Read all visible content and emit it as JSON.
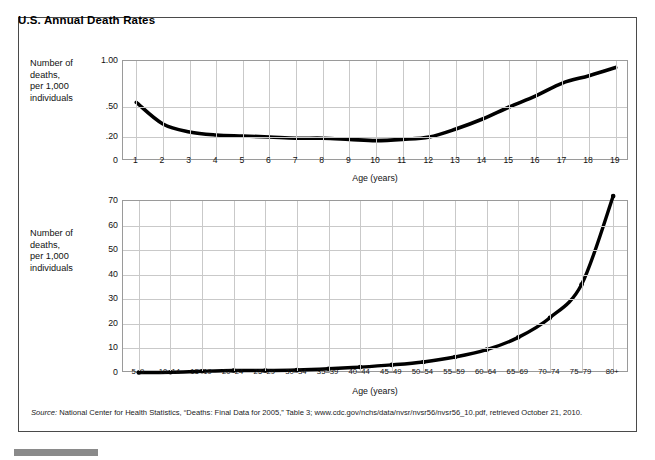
{
  "figure": {
    "title": "U.S. Annual Death Rates",
    "source_label": "Source:",
    "source_text": " National Center for Health Statistics, “Deaths: Final Data for 2005,” Table 3; www.cdc.gov/nchs/data/nvsr/nvsr56/nvsr56_10.pdf, retrieved October 21, 2010."
  },
  "chart_data": [
    {
      "type": "line",
      "title": "",
      "ylabel": "Number of\ndeaths,\nper 1,000\nindividuals",
      "xlabel": "Age (years)",
      "categories": [
        "1",
        "2",
        "3",
        "4",
        "5",
        "6",
        "7",
        "8",
        "9",
        "10",
        "11",
        "12",
        "13",
        "14",
        "15",
        "16",
        "17",
        "18",
        "19"
      ],
      "values": [
        0.55,
        0.33,
        0.25,
        0.22,
        0.21,
        0.2,
        0.19,
        0.19,
        0.18,
        0.17,
        0.18,
        0.2,
        0.28,
        0.38,
        0.5,
        0.62,
        0.76,
        0.84,
        0.93
      ],
      "ytick_labels": [
        "1.00",
        ".50",
        ".20",
        "0"
      ],
      "ytick_values": [
        1.0,
        0.5,
        0.2,
        0.0
      ],
      "ytick_positions": [
        0.0,
        0.46,
        0.76,
        1.0
      ],
      "ylim": [
        0,
        1.0
      ],
      "grid": true,
      "legend": "none"
    },
    {
      "type": "line",
      "title": "",
      "ylabel": "Number of\ndeaths,\nper 1,000\nindividuals",
      "xlabel": "Age (years)",
      "categories": [
        "5–9",
        "10–14",
        "15–19",
        "20–24",
        "25–29",
        "30–34",
        "35–39",
        "40–44",
        "45–49",
        "50–54",
        "55–59",
        "60–64",
        "65–69",
        "70–74",
        "75–79",
        "80+"
      ],
      "values": [
        0.2,
        0.3,
        0.7,
        1.0,
        1.0,
        1.2,
        1.7,
        2.4,
        3.3,
        4.5,
        6.5,
        9.5,
        14.5,
        22.5,
        36.0,
        72.0
      ],
      "ytick_labels": [
        "70",
        "60",
        "50",
        "40",
        "30",
        "20",
        "10",
        "0"
      ],
      "ytick_values": [
        70,
        60,
        50,
        40,
        30,
        20,
        10,
        0
      ],
      "ylim": [
        0,
        70
      ],
      "grid": true,
      "legend": "none"
    }
  ]
}
